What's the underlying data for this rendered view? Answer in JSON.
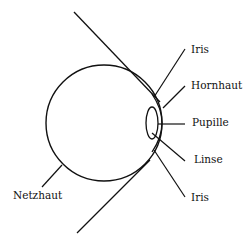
{
  "diagram": {
    "stroke_color": "#111111",
    "labels": {
      "iris_top": "Iris",
      "hornhaut": "Hornhaut",
      "pupille": "Pupille",
      "linse": "Linse",
      "iris_bottom": "Iris",
      "netzhaut": "Netzhaut"
    }
  }
}
